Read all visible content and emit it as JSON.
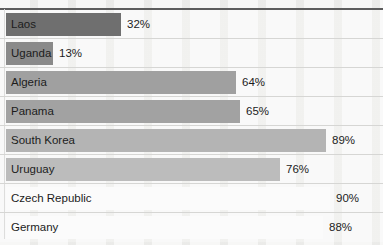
{
  "chart_data": {
    "type": "bar",
    "orientation": "horizontal",
    "title": "",
    "subtitle": "",
    "xlabel": "",
    "ylabel": "",
    "xlim": [
      0,
      100
    ],
    "grid": true,
    "legend": null,
    "value_suffix": "%",
    "categories": [
      "Laos",
      "Uganda",
      "Algeria",
      "Panama",
      "South Korea",
      "Uruguay",
      "Czech Republic",
      "Germany"
    ],
    "values": [
      32,
      13,
      64,
      65,
      89,
      76,
      90,
      88
    ],
    "value_labels": [
      "32%",
      "13%",
      "64%",
      "65%",
      "89%",
      "76%",
      "90%",
      "88%"
    ],
    "bar_colors": [
      "#6f6f6f",
      "#8a8a8a",
      "#a0a0a0",
      "#a2a2a2",
      "#b4b4b4",
      "#bcbcbc",
      "#fbfbfb",
      "#fbfbfb"
    ],
    "rows": [
      {
        "label": "Laos",
        "value": 32,
        "value_label": "32%",
        "color": "#6f6f6f"
      },
      {
        "label": "Uganda",
        "value": 13,
        "value_label": "13%",
        "color": "#8a8a8a"
      },
      {
        "label": "Algeria",
        "value": 64,
        "value_label": "64%",
        "color": "#a0a0a0"
      },
      {
        "label": "Panama",
        "value": 65,
        "value_label": "65%",
        "color": "#a2a2a2"
      },
      {
        "label": "South Korea",
        "value": 89,
        "value_label": "89%",
        "color": "#b4b4b4"
      },
      {
        "label": "Uruguay",
        "value": 76,
        "value_label": "76%",
        "color": "#bcbcbc"
      },
      {
        "label": "Czech Republic",
        "value": 90,
        "value_label": "90%",
        "color": "#fbfbfb"
      },
      {
        "label": "Germany",
        "value": 88,
        "value_label": "88%",
        "color": "#fbfbfb"
      }
    ]
  },
  "style": {
    "background": "#eeeeec",
    "top_rule_color": "#5d5d5d",
    "gridline_color": "#d6d6d4",
    "text_color": "#1c1c1c"
  }
}
